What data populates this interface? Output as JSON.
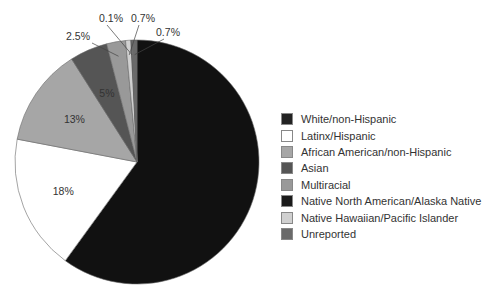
{
  "chart_data": {
    "type": "pie",
    "title": "",
    "start_angle_deg": 0,
    "direction": "clockwise",
    "slices": [
      {
        "label": "White/non-Hispanic",
        "value": 60.0,
        "display": "",
        "color": "#111111"
      },
      {
        "label": "Latinx/Hispanic",
        "value": 18,
        "display": "18%",
        "color": "#ffffff"
      },
      {
        "label": "African American/non-Hispanic",
        "value": 13,
        "display": "13%",
        "color": "#a6a6a6"
      },
      {
        "label": "Asian",
        "value": 5,
        "display": "5%",
        "color": "#555555"
      },
      {
        "label": "Multiracial",
        "value": 2.5,
        "display": "2.5%",
        "color": "#999999"
      },
      {
        "label": "Native Hawaiian/Pacific Islander",
        "value": 0.7,
        "display": "0.7%",
        "color": "#d0d0d0"
      },
      {
        "label": "Native North American/Alaska Native",
        "value": 0.1,
        "display": "0.1%",
        "color": "#1a1a1a"
      },
      {
        "label": "Unreported",
        "value": 0.7,
        "display": "0.7%",
        "color": "#6a6a6a"
      }
    ],
    "legend": {
      "position": "right",
      "entries": [
        {
          "label": "White/non-Hispanic",
          "color": "#222222"
        },
        {
          "label": "Latinx/Hispanic",
          "color": "#ffffff"
        },
        {
          "label": "African American/non-Hispanic",
          "color": "#a6a6a6"
        },
        {
          "label": "Asian",
          "color": "#555555"
        },
        {
          "label": "Multiracial",
          "color": "#999999"
        },
        {
          "label": "Native North American/Alaska Native",
          "color": "#1a1a1a"
        },
        {
          "label": "Native Hawaiian/Pacific Islander",
          "color": "#d0d0d0"
        },
        {
          "label": "Unreported",
          "color": "#6a6a6a"
        }
      ]
    }
  }
}
